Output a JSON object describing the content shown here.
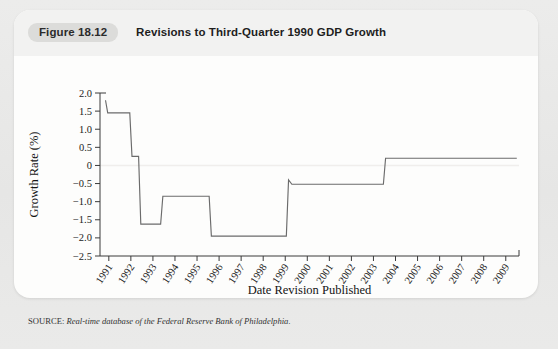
{
  "figure": {
    "badge": "Figure 18.12",
    "title": "Revisions to Third-Quarter 1990 GDP Growth",
    "source_label": "SOURCE:",
    "source_text": "Real-time database of the Federal Reserve Bank of Philadelphia."
  },
  "colors": {
    "page_background": "#e9e9e9",
    "card_background": "#fdfdfc",
    "header_strip": "#f2f2f1",
    "badge_background": "#dcdcda",
    "line": "#6b6b6b",
    "axis": "#3a3a3a",
    "zero_gridline": "#f0eeec"
  },
  "chart_data": {
    "type": "line",
    "title": "Revisions to Third-Quarter 1990 GDP Growth",
    "xlabel": "Date Revision Published",
    "ylabel": "Growth Rate (%)",
    "xlim": [
      1990.6,
      2009.6
    ],
    "ylim": [
      -2.5,
      2.0
    ],
    "grid": false,
    "legend": null,
    "yticks": [
      2.0,
      1.5,
      1.0,
      0.5,
      0,
      -0.5,
      -1.0,
      -1.5,
      -2.0,
      -2.5
    ],
    "ytick_labels": [
      "2.0",
      "1.5",
      "1.0",
      "0.5",
      "0",
      "-0.5",
      "-1.0",
      "-1.5",
      "-2.0",
      "-2.5"
    ],
    "xticks": [
      1991,
      1992,
      1993,
      1994,
      1995,
      1996,
      1997,
      1998,
      1999,
      2000,
      2001,
      2002,
      2003,
      2004,
      2005,
      2006,
      2007,
      2008,
      2009
    ],
    "xtick_labels": [
      "1991",
      "1992",
      "1993",
      "1994",
      "1995",
      "1996",
      "1997",
      "1998",
      "1999",
      "2000",
      "2001",
      "2002",
      "2003",
      "2004",
      "2005",
      "2006",
      "2007",
      "2008",
      "2009"
    ],
    "series": [
      {
        "name": "Third-Quarter 1990 GDP growth estimate",
        "x": [
          1990.85,
          1990.95,
          1991.05,
          1991.95,
          1992.05,
          1992.35,
          1992.45,
          1993.35,
          1993.45,
          1994.0,
          1994.05,
          1995.55,
          1995.65,
          1999.05,
          1999.15,
          1999.3,
          2003.45,
          2003.55,
          2009.5
        ],
        "y": [
          1.8,
          1.45,
          1.45,
          1.45,
          0.25,
          0.25,
          -1.62,
          -1.62,
          -0.85,
          -0.85,
          -0.85,
          -0.85,
          -1.95,
          -1.95,
          -0.4,
          -0.52,
          -0.52,
          0.2,
          0.2
        ]
      }
    ]
  }
}
